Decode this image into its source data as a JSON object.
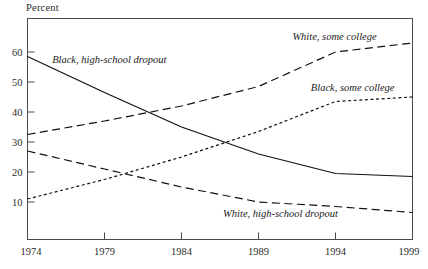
{
  "chart_data": {
    "type": "line",
    "title": "",
    "ylabel": "Percent",
    "xlabel": "",
    "x": [
      1974,
      1979,
      1984,
      1989,
      1994,
      1999
    ],
    "xlim": [
      1974,
      1999
    ],
    "ylim": [
      0,
      68
    ],
    "grid": false,
    "legend": "inline-annotations",
    "xticks": [
      "1974",
      "1979",
      "1984",
      "1989",
      "1994",
      "1999"
    ],
    "yticks": [
      "60",
      "50",
      "40",
      "30",
      "20",
      "10"
    ],
    "ytick_values": [
      60,
      50,
      40,
      30,
      20,
      10
    ],
    "series": [
      {
        "name": "Black, high-school dropout",
        "style": "solid",
        "values": [
          58.5,
          46.5,
          35.0,
          26.0,
          19.5,
          18.5
        ]
      },
      {
        "name": "White, some college",
        "style": "long-dash",
        "values": [
          32.5,
          37.0,
          42.0,
          48.5,
          60.0,
          63.0
        ]
      },
      {
        "name": "Black, some college",
        "style": "dotted",
        "values": [
          11.0,
          17.5,
          25.0,
          33.5,
          43.5,
          45.0
        ]
      },
      {
        "name": "White, high-school dropout",
        "style": "long-dash",
        "values": [
          27.0,
          21.0,
          15.0,
          10.0,
          8.5,
          6.5
        ]
      }
    ],
    "annotations": [
      {
        "text": "Black, high-school dropout",
        "x": 1975.6,
        "y": 56.5
      },
      {
        "text": "White, some college",
        "x": 1991.2,
        "y": 64.0
      },
      {
        "text": "Black, some college",
        "x": 1992.4,
        "y": 47.0
      },
      {
        "text": "White, high-school dropout",
        "x": 1986.7,
        "y": 5.0
      }
    ]
  },
  "colors": {
    "line": "#111111",
    "axis": "#4a4a4a",
    "text": "#1a1a1a",
    "background": "#ffffff"
  }
}
